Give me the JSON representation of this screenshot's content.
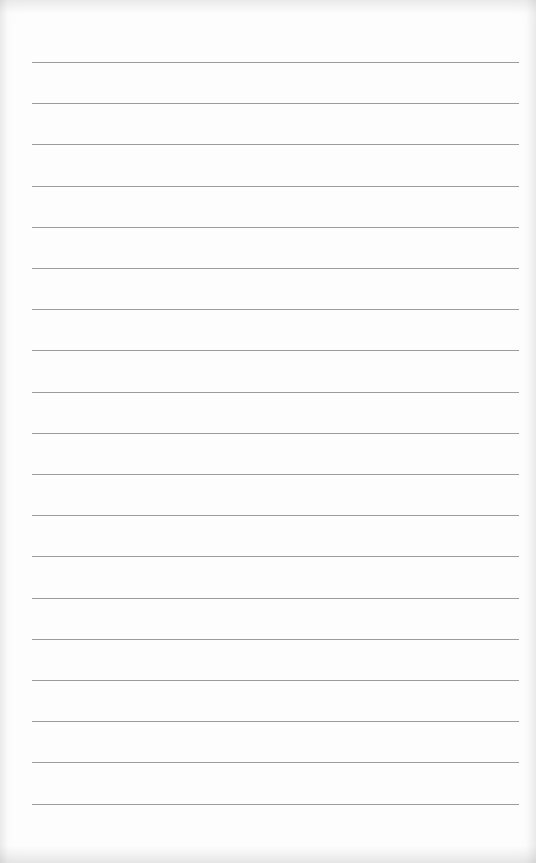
{
  "page": {
    "type": "blank lined notepad page",
    "background_color": "#fdfdfd",
    "line_color": "#9c9c9c",
    "line_count": 19,
    "first_line_y": 62,
    "line_spacing": 41.2,
    "line_left_x": 32,
    "line_right_x": 519,
    "text_content": ""
  }
}
